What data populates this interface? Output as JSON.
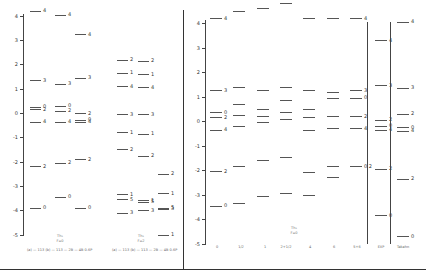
{
  "figure": {
    "left_panel": {
      "y_ticks": [
        "4",
        "3",
        "2",
        "1",
        "0",
        "-1",
        "-2",
        "-3",
        "-4",
        "-5"
      ],
      "groups": [
        {
          "label": "Th₂",
          "sub": "F=0",
          "caption": "(a) — 113 (b) — 113 — 2B — 4B 0.6P"
        },
        {
          "label": "Th₂",
          "sub": "F=2",
          "caption": "(a) — 113 (b) — 113 — 2B — 4B 0.6P"
        }
      ],
      "columns": [
        {
          "levels": [
            {
              "e": 4.2,
              "l": "4"
            },
            {
              "e": 1.35,
              "l": "3"
            },
            {
              "e": 0.25,
              "l": "0"
            },
            {
              "e": 0.15,
              "l": "2"
            },
            {
              "e": -0.35,
              "l": "4"
            },
            {
              "e": -2.2,
              "l": "2"
            },
            {
              "e": -3.9,
              "l": "0"
            }
          ]
        },
        {
          "levels": [
            {
              "e": 4.05,
              "l": "4"
            },
            {
              "e": 1.2,
              "l": "3"
            },
            {
              "e": 0.3,
              "l": "0"
            },
            {
              "e": 0.1,
              "l": "2"
            },
            {
              "e": -0.35,
              "l": "4"
            },
            {
              "e": -2.05,
              "l": "2"
            },
            {
              "e": -3.45,
              "l": "0"
            }
          ]
        },
        {
          "levels": [
            {
              "e": 3.25,
              "l": "4"
            },
            {
              "e": 1.45,
              "l": "3"
            },
            {
              "e": 0.0,
              "l": "2"
            },
            {
              "e": -0.28,
              "l": "0"
            },
            {
              "e": -0.35,
              "l": "4"
            },
            {
              "e": -1.9,
              "l": "2"
            },
            {
              "e": -3.9,
              "l": "0"
            }
          ]
        },
        {
          "levels": [
            {
              "e": 2.2,
              "l": "2"
            },
            {
              "e": 1.65,
              "l": "1"
            },
            {
              "e": 1.1,
              "l": "4"
            },
            {
              "e": -0.05,
              "l": "3"
            },
            {
              "e": -0.8,
              "l": "1"
            },
            {
              "e": -1.5,
              "l": "2"
            },
            {
              "e": -3.35,
              "l": "1"
            },
            {
              "e": -3.55,
              "l": "5"
            },
            {
              "e": -4.1,
              "l": "3"
            }
          ]
        },
        {
          "levels": [
            {
              "e": 2.15,
              "l": "2"
            },
            {
              "e": 1.6,
              "l": "1"
            },
            {
              "e": 1.05,
              "l": "4"
            },
            {
              "e": -0.05,
              "l": "3"
            },
            {
              "e": -0.85,
              "l": "1"
            },
            {
              "e": -1.75,
              "l": "2"
            },
            {
              "e": -3.6,
              "l": "1"
            },
            {
              "e": -3.65,
              "l": "5"
            },
            {
              "e": -4.0,
              "l": "3"
            }
          ]
        },
        {
          "levels": [
            {
              "e": -2.5,
              "l": "2"
            },
            {
              "e": -3.3,
              "l": "1"
            },
            {
              "e": -3.9,
              "l": "5"
            },
            {
              "e": -3.95,
              "l": "3"
            },
            {
              "e": -5.0,
              "l": "1"
            }
          ]
        }
      ]
    },
    "right_panel": {
      "y_ticks": [
        "4",
        "3",
        "2",
        "1",
        "0",
        "-1",
        "-2",
        "-3",
        "-4",
        "-5"
      ],
      "group_label": "Th₂",
      "group_sub": "F=0",
      "x_labels": [
        "0",
        "1/2",
        "1",
        "2+1/2",
        "4",
        "6",
        "5+6",
        "EXP",
        "Takahn"
      ],
      "columns": [
        {
          "levels": [
            {
              "e": 4.2,
              "l": "4"
            },
            {
              "e": 1.25,
              "l": "3"
            },
            {
              "e": 0.35,
              "l": "0"
            },
            {
              "e": 0.15,
              "l": "2"
            },
            {
              "e": -0.35,
              "l": "4"
            },
            {
              "e": -2.05,
              "l": "2"
            },
            {
              "e": -3.45,
              "l": "0"
            }
          ]
        },
        {
          "levels": [
            {
              "e": 4.5,
              "l": ""
            },
            {
              "e": 1.4,
              "l": ""
            },
            {
              "e": 0.7,
              "l": ""
            },
            {
              "e": 0.25,
              "l": ""
            },
            {
              "e": -0.2,
              "l": ""
            },
            {
              "e": -1.85,
              "l": ""
            },
            {
              "e": -3.35,
              "l": ""
            }
          ]
        },
        {
          "levels": [
            {
              "e": 4.6,
              "l": ""
            },
            {
              "e": 1.25,
              "l": ""
            },
            {
              "e": 0.5,
              "l": ""
            },
            {
              "e": 0.2,
              "l": ""
            },
            {
              "e": -0.05,
              "l": ""
            },
            {
              "e": -1.6,
              "l": ""
            },
            {
              "e": -3.05,
              "l": ""
            }
          ]
        },
        {
          "levels": [
            {
              "e": 4.8,
              "l": ""
            },
            {
              "e": 1.4,
              "l": ""
            },
            {
              "e": 0.85,
              "l": ""
            },
            {
              "e": 0.35,
              "l": ""
            },
            {
              "e": 0.1,
              "l": ""
            },
            {
              "e": -1.45,
              "l": ""
            },
            {
              "e": -2.95,
              "l": ""
            }
          ]
        },
        {
          "levels": [
            {
              "e": 4.2,
              "l": ""
            },
            {
              "e": 1.25,
              "l": ""
            },
            {
              "e": 0.5,
              "l": ""
            },
            {
              "e": 0.15,
              "l": ""
            },
            {
              "e": -0.35,
              "l": ""
            },
            {
              "e": -2.1,
              "l": ""
            },
            {
              "e": -3.0,
              "l": ""
            }
          ]
        },
        {
          "levels": [
            {
              "e": 4.2,
              "l": ""
            },
            {
              "e": 1.2,
              "l": ""
            },
            {
              "e": 0.95,
              "l": ""
            },
            {
              "e": 0.2,
              "l": ""
            },
            {
              "e": -0.3,
              "l": ""
            },
            {
              "e": -1.85,
              "l": ""
            },
            {
              "e": -2.3,
              "l": ""
            }
          ]
        },
        {
          "levels": [
            {
              "e": 4.2,
              "l": "4"
            },
            {
              "e": 1.25,
              "l": "3"
            },
            {
              "e": 0.95,
              "l": "0"
            },
            {
              "e": 0.2,
              "l": "2"
            },
            {
              "e": -0.3,
              "l": "4"
            },
            {
              "e": -1.85,
              "l": "0 2"
            }
          ]
        },
        {
          "levels": [
            {
              "e": 3.3,
              "l": "4"
            },
            {
              "e": 1.45,
              "l": "3"
            },
            {
              "e": 0.05,
              "l": "2"
            },
            {
              "e": -0.2,
              "l": "0"
            },
            {
              "e": -0.35,
              "l": "4"
            },
            {
              "e": -1.95,
              "l": "2"
            },
            {
              "e": -3.85,
              "l": "0"
            }
          ]
        },
        {
          "levels": [
            {
              "e": 4.05,
              "l": "4"
            },
            {
              "e": 1.35,
              "l": "3"
            },
            {
              "e": 0.3,
              "l": "2"
            },
            {
              "e": -0.25,
              "l": "0"
            },
            {
              "e": -0.4,
              "l": "4"
            },
            {
              "e": -2.35,
              "l": "2"
            },
            {
              "e": -4.7,
              "l": "0"
            }
          ]
        }
      ]
    }
  }
}
